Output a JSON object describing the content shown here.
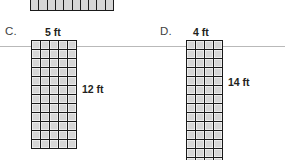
{
  "figure": {
    "type": "geometry-worksheet-diagram",
    "background_color": "#ffffff",
    "ink_color": "#1a1a1a",
    "cell_fill_color": "#d6d6d6",
    "rule_line_color": "#b9b9b9"
  },
  "rule_line": {
    "name": "horizontal-rule",
    "y": 46
  },
  "top_partial": {
    "name": "partial-grid-strip",
    "columns": 10,
    "rows": 1,
    "clipped": "top",
    "x": 30,
    "y": 0,
    "width": 82,
    "height": 10
  },
  "items": [
    {
      "id": "C",
      "letter": "C.",
      "width_label": "5 ft",
      "height_label": "12 ft",
      "columns": 5,
      "rows": 12,
      "cell_size": 8,
      "grid_x": 31,
      "grid_y": 40,
      "letter_x": 5,
      "letter_y": 26,
      "width_label_x": 45,
      "width_label_y": 27,
      "height_label_x": 82,
      "height_label_y": 84
    },
    {
      "id": "D",
      "letter": "D.",
      "width_label": "4 ft",
      "height_label": "14 ft",
      "columns": 4,
      "rows": 14,
      "cell_size": 8,
      "grid_x": 186,
      "grid_y": 40,
      "letter_x": 160,
      "letter_y": 26,
      "width_label_x": 193,
      "width_label_y": 27,
      "height_label_x": 228,
      "height_label_y": 77
    }
  ]
}
